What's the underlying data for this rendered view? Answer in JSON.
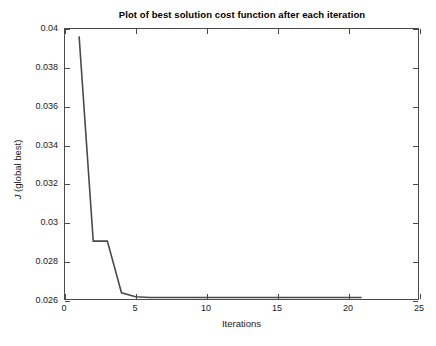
{
  "chart_data": {
    "type": "line",
    "title": "Plot of best solution cost function after each iteration",
    "xlabel": "Iterations",
    "ylabel": "J (global best)",
    "ylabel_italic_prefix": "J",
    "ylabel_rest": " (global best)",
    "xlim": [
      0,
      25
    ],
    "ylim": [
      0.026,
      0.04
    ],
    "xticks": [
      0,
      5,
      10,
      15,
      20,
      25
    ],
    "xtick_labels": [
      "0",
      "5",
      "10",
      "15",
      "20",
      "25"
    ],
    "yticks": [
      0.026,
      0.028,
      0.03,
      0.032,
      0.034,
      0.036,
      0.038,
      0.04
    ],
    "ytick_labels": [
      "0.026",
      "0.028",
      "0.03",
      "0.032",
      "0.034",
      "0.036",
      "0.038",
      "0.04"
    ],
    "grid": false,
    "legend": null,
    "line_color": "#4a4a4a",
    "line_width": 1.6,
    "x": [
      1,
      2,
      3,
      4,
      5,
      6,
      7,
      8,
      9,
      10,
      11,
      12,
      13,
      14,
      15,
      16,
      17,
      18,
      19,
      20,
      21
    ],
    "series": [
      {
        "name": "J (global best)",
        "values": [
          0.03962,
          0.029,
          0.029,
          0.02632,
          0.02612,
          0.02608,
          0.02608,
          0.02608,
          0.02608,
          0.02608,
          0.02608,
          0.02608,
          0.02608,
          0.02608,
          0.02608,
          0.02608,
          0.02608,
          0.02608,
          0.02608,
          0.02608,
          0.02608
        ]
      }
    ]
  }
}
